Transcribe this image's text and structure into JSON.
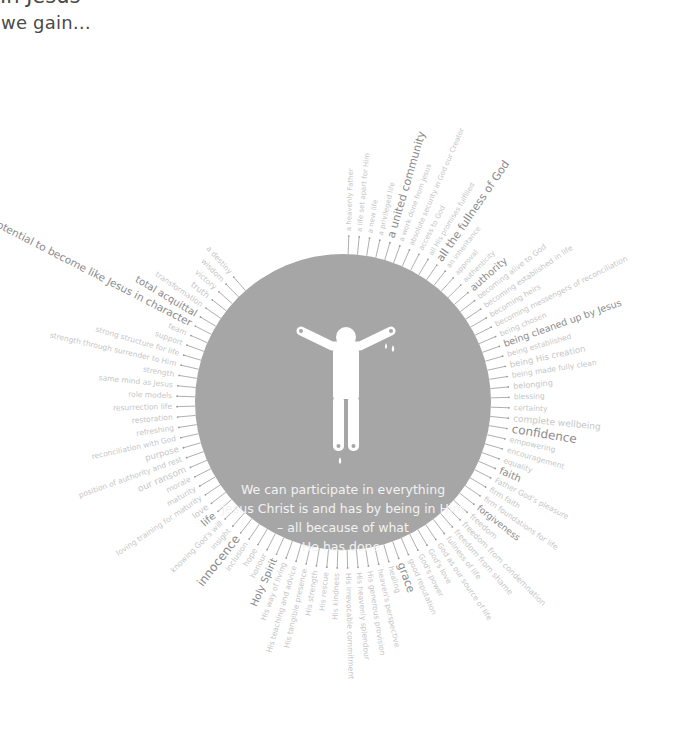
{
  "header": {
    "title_partial": "In Jesus",
    "subtitle": "we gain…"
  },
  "center": {
    "circle_color": "#a6a6a6",
    "icon": "figure-with-outstretched-arms-icon",
    "message_lines": [
      "We can participate in everything",
      "Jesus Christ is and has by being in Him",
      "– all because of what",
      "He has done."
    ]
  },
  "colors": {
    "spoke": "#9a9a9a",
    "label_light": "#c6c6c6",
    "label_dark": "#8a8a8a"
  },
  "labels": [
    {
      "text": "a heavenly Father",
      "angle": -88,
      "size": 7,
      "emph": false
    },
    {
      "text": "a life set apart for Him",
      "angle": -84.4,
      "size": 7,
      "emph": false
    },
    {
      "text": "a new life",
      "angle": -80.8,
      "size": 7,
      "emph": false
    },
    {
      "text": "a privileged life",
      "angle": -77.2,
      "size": 7,
      "emph": false
    },
    {
      "text": "a united community",
      "angle": -73.6,
      "size": 11,
      "emph": true
    },
    {
      "text": "a work done from Jesus",
      "angle": -70,
      "size": 7,
      "emph": false
    },
    {
      "text": "absolute security in God our Creator",
      "angle": -66.4,
      "size": 7,
      "emph": false
    },
    {
      "text": "access to God",
      "angle": -62.8,
      "size": 7,
      "emph": false
    },
    {
      "text": "all His promises fulfilled",
      "angle": -59.2,
      "size": 7,
      "emph": false
    },
    {
      "text": "all the fullness of God",
      "angle": -55.6,
      "size": 11,
      "emph": true
    },
    {
      "text": "an inheritance",
      "angle": -52,
      "size": 7,
      "emph": false
    },
    {
      "text": "approval",
      "angle": -48.4,
      "size": 7,
      "emph": false
    },
    {
      "text": "authenticity",
      "angle": -44.8,
      "size": 7,
      "emph": false
    },
    {
      "text": "authority",
      "angle": -41.2,
      "size": 10,
      "emph": true
    },
    {
      "text": "becoming alive to God",
      "angle": -37.6,
      "size": 7.5,
      "emph": false
    },
    {
      "text": "becoming established in life",
      "angle": -34,
      "size": 7.5,
      "emph": false
    },
    {
      "text": "becoming heirs",
      "angle": -30.4,
      "size": 7.5,
      "emph": false
    },
    {
      "text": "becoming messengers of reconciliation",
      "angle": -26.8,
      "size": 7.5,
      "emph": false
    },
    {
      "text": "being chosen",
      "angle": -23.2,
      "size": 7.5,
      "emph": false
    },
    {
      "text": "being cleaned up by Jesus",
      "angle": -19.6,
      "size": 9.5,
      "emph": true
    },
    {
      "text": "being established",
      "angle": -16,
      "size": 7.5,
      "emph": false
    },
    {
      "text": "being His creation",
      "angle": -12.4,
      "size": 8.5,
      "emph": false
    },
    {
      "text": "being made fully clean",
      "angle": -8.8,
      "size": 7.5,
      "emph": false
    },
    {
      "text": "belonging",
      "angle": -5.2,
      "size": 8,
      "emph": false
    },
    {
      "text": "blessing",
      "angle": -1.6,
      "size": 7.5,
      "emph": false
    },
    {
      "text": "certainty",
      "angle": 2,
      "size": 7.5,
      "emph": false
    },
    {
      "text": "complete wellbeing",
      "angle": 5.6,
      "size": 9,
      "emph": false
    },
    {
      "text": "confidence",
      "angle": 9.2,
      "size": 12,
      "emph": true
    },
    {
      "text": "empowering",
      "angle": 12.8,
      "size": 7.5,
      "emph": false
    },
    {
      "text": "encouragement",
      "angle": 16.4,
      "size": 7.5,
      "emph": false
    },
    {
      "text": "equality",
      "angle": 20,
      "size": 7.5,
      "emph": false
    },
    {
      "text": "faith",
      "angle": 23.6,
      "size": 10,
      "emph": true
    },
    {
      "text": "Father God's pleasure",
      "angle": 27.2,
      "size": 7.5,
      "emph": false
    },
    {
      "text": "firm faith",
      "angle": 30.8,
      "size": 7.5,
      "emph": false
    },
    {
      "text": "firm foundations for life",
      "angle": 34.4,
      "size": 7.5,
      "emph": false
    },
    {
      "text": "forgiveness",
      "angle": 38,
      "size": 9,
      "emph": true
    },
    {
      "text": "freedom",
      "angle": 41.6,
      "size": 8,
      "emph": false
    },
    {
      "text": "freedom from condemnation",
      "angle": 45.2,
      "size": 8,
      "emph": false
    },
    {
      "text": "freedom from shame",
      "angle": 48.8,
      "size": 8,
      "emph": false
    },
    {
      "text": "fullness of life",
      "angle": 52.4,
      "size": 7.5,
      "emph": false
    },
    {
      "text": "God as our source of life",
      "angle": 56,
      "size": 7.5,
      "emph": false
    },
    {
      "text": "God's love",
      "angle": 59.6,
      "size": 7.5,
      "emph": false
    },
    {
      "text": "God's power",
      "angle": 63.2,
      "size": 7.5,
      "emph": false
    },
    {
      "text": "good reputation",
      "angle": 66.8,
      "size": 7.5,
      "emph": false
    },
    {
      "text": "grace",
      "angle": 70.4,
      "size": 11,
      "emph": true
    },
    {
      "text": "healing",
      "angle": 74,
      "size": 7.5,
      "emph": false
    },
    {
      "text": "heaven's perspective",
      "angle": 77.6,
      "size": 7.5,
      "emph": false
    },
    {
      "text": "His generous provision",
      "angle": 81.2,
      "size": 7.5,
      "emph": false
    },
    {
      "text": "His heavenly splendour",
      "angle": 84.8,
      "size": 7.5,
      "emph": false
    },
    {
      "text": "His irrevocable commitment",
      "angle": 88.4,
      "size": 7.5,
      "emph": false
    },
    {
      "text": "His kindness",
      "angle": 92,
      "size": 7.5,
      "emph": false
    },
    {
      "text": "His rescue",
      "angle": 95.6,
      "size": 7.5,
      "emph": false
    },
    {
      "text": "His strength",
      "angle": 99.2,
      "size": 7.5,
      "emph": false
    },
    {
      "text": "His tangible presence",
      "angle": 102.8,
      "size": 7.5,
      "emph": false
    },
    {
      "text": "His teaching and advice",
      "angle": 106.4,
      "size": 7.5,
      "emph": false
    },
    {
      "text": "His way of living",
      "angle": 110,
      "size": 7.5,
      "emph": false
    },
    {
      "text": "Holy Spirit",
      "angle": 113.6,
      "size": 10,
      "emph": true
    },
    {
      "text": "honour",
      "angle": 117.2,
      "size": 7.5,
      "emph": false
    },
    {
      "text": "hope",
      "angle": 120.8,
      "size": 8,
      "emph": false
    },
    {
      "text": "inclusion",
      "angle": 124.4,
      "size": 7.5,
      "emph": false
    },
    {
      "text": "innocence",
      "angle": 128,
      "size": 12,
      "emph": true
    },
    {
      "text": "insight",
      "angle": 131.6,
      "size": 7.5,
      "emph": false
    },
    {
      "text": "knowing God's will",
      "angle": 135.2,
      "size": 7.5,
      "emph": false
    },
    {
      "text": "life",
      "angle": 138.8,
      "size": 10,
      "emph": true
    },
    {
      "text": "love",
      "angle": 142.4,
      "size": 8.5,
      "emph": false
    },
    {
      "text": "loving training for maturity",
      "angle": 146,
      "size": 7.5,
      "emph": false
    },
    {
      "text": "maturity",
      "angle": 149.6,
      "size": 7.5,
      "emph": false
    },
    {
      "text": "morale",
      "angle": 153.2,
      "size": 7.5,
      "emph": false
    },
    {
      "text": "our ransom",
      "angle": 156.8,
      "size": 9,
      "emph": false
    },
    {
      "text": "position of authority and rest",
      "angle": 160.4,
      "size": 7.5,
      "emph": false
    },
    {
      "text": "purpose",
      "angle": 164,
      "size": 8.5,
      "emph": false
    },
    {
      "text": "reconciliation with God",
      "angle": 167.6,
      "size": 7.5,
      "emph": false
    },
    {
      "text": "refreshing",
      "angle": 171.2,
      "size": 7.5,
      "emph": false
    },
    {
      "text": "restoration",
      "angle": 174.8,
      "size": 7.5,
      "emph": false
    },
    {
      "text": "resurrection life",
      "angle": 178.4,
      "size": 7.5,
      "emph": false
    },
    {
      "text": "role models",
      "angle": 182,
      "size": 7.5,
      "emph": false
    },
    {
      "text": "same mind as Jesus",
      "angle": 185.6,
      "size": 7.5,
      "emph": false
    },
    {
      "text": "strength",
      "angle": 189.2,
      "size": 7.5,
      "emph": false
    },
    {
      "text": "strength through surrender to Him",
      "angle": 192.8,
      "size": 7.5,
      "emph": false
    },
    {
      "text": "strong structure for life",
      "angle": 196.4,
      "size": 7.5,
      "emph": false
    },
    {
      "text": "support",
      "angle": 200,
      "size": 7.5,
      "emph": false
    },
    {
      "text": "team",
      "angle": 203.6,
      "size": 7.5,
      "emph": false
    },
    {
      "text": "the potential to become like Jesus in character",
      "angle": 207.2,
      "size": 10.5,
      "emph": true
    },
    {
      "text": "total acquittal",
      "angle": 210.8,
      "size": 10,
      "emph": true
    },
    {
      "text": "transformation",
      "angle": 214.4,
      "size": 7.5,
      "emph": false
    },
    {
      "text": "truth",
      "angle": 218,
      "size": 8.5,
      "emph": false
    },
    {
      "text": "victory",
      "angle": 221.6,
      "size": 7.5,
      "emph": false
    },
    {
      "text": "wisdom",
      "angle": 225.2,
      "size": 7.5,
      "emph": false
    },
    {
      "text": "a destiny",
      "angle": 228.8,
      "size": 7.5,
      "emph": false
    }
  ]
}
